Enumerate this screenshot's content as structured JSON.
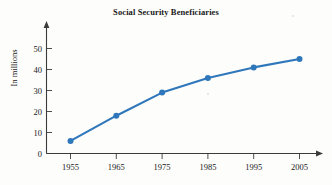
{
  "figure": {
    "title": "Social Security Beneficiaries",
    "y_axis_label": "In millions"
  },
  "chart_data": {
    "type": "line",
    "title": "Social Security Beneficiaries",
    "xlabel": "",
    "ylabel": "In millions",
    "categories": [
      "1955",
      "1965",
      "1975",
      "1985",
      "1995",
      "2005"
    ],
    "x": [
      1955,
      1965,
      1975,
      1985,
      1995,
      2005
    ],
    "values": [
      6,
      18,
      29,
      36,
      41,
      45
    ],
    "xlim": [
      1950,
      2010
    ],
    "ylim": [
      0,
      55
    ],
    "ytick_labels": [
      "0",
      "10",
      "20",
      "30",
      "40",
      "50"
    ],
    "yticks": [
      0,
      10,
      20,
      30,
      40,
      50
    ],
    "xtick_labels": [
      "1955",
      "1965",
      "1975",
      "1985",
      "1995",
      "2005"
    ],
    "grid": false,
    "legend": false,
    "series_color": "#2f77bb",
    "marker": "circle",
    "marker_color": "#2f77bb",
    "axis_color": "#3b3b3b"
  }
}
